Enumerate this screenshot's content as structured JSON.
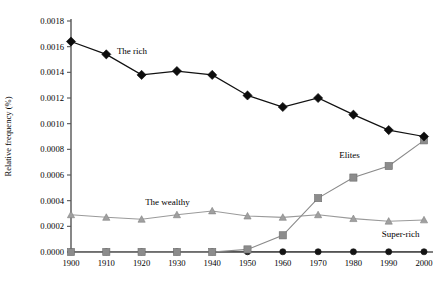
{
  "chart_data": {
    "type": "line",
    "title": "",
    "xlabel": "",
    "ylabel": "Relative frequency (%)",
    "x": [
      1900,
      1910,
      1920,
      1930,
      1940,
      1950,
      1960,
      1970,
      1980,
      1990,
      2000
    ],
    "xtick_labels": [
      "1900",
      "1910",
      "1920",
      "1930",
      "1940",
      "1950",
      "1960",
      "1970",
      "1980",
      "1990",
      "2000"
    ],
    "ytick_labels": [
      "0.0000",
      "0.0002",
      "0.0004",
      "0.0006",
      "0.0008",
      "0.0010",
      "0.0012",
      "0.0014",
      "0.0016",
      "0.0018"
    ],
    "ytick_values": [
      0.0,
      0.0002,
      0.0004,
      0.0006,
      0.0008,
      0.001,
      0.0012,
      0.0014,
      0.0016,
      0.0018
    ],
    "xlim": [
      1900,
      2000
    ],
    "ylim": [
      0.0,
      0.0018
    ],
    "grid": false,
    "legend_position": "inline-annotations",
    "series": [
      {
        "name": "The rich",
        "marker": "diamond",
        "color": "#0d0d0d",
        "label_x": 1913,
        "label_y": 0.00154,
        "values": [
          0.00164,
          0.00154,
          0.00138,
          0.00141,
          0.00138,
          0.00122,
          0.00113,
          0.0012,
          0.00107,
          0.00095,
          0.0009
        ]
      },
      {
        "name": "Elites",
        "marker": "square",
        "color": "#8c8c8c",
        "label_x": 1976,
        "label_y": 0.00073,
        "values": [
          0.0,
          0.0,
          0.0,
          0.0,
          0.0,
          2e-05,
          0.00013,
          0.00042,
          0.00058,
          0.00067,
          0.00087
        ]
      },
      {
        "name": "The wealthy",
        "marker": "triangle",
        "color": "#a0a0a0",
        "label_x": 1921,
        "label_y": 0.00037,
        "values": [
          0.00029,
          0.00027,
          0.000255,
          0.00029,
          0.00032,
          0.00028,
          0.00027,
          0.00029,
          0.00026,
          0.00024,
          0.00025
        ]
      },
      {
        "name": "Super-rich",
        "marker": "circle",
        "color": "#141414",
        "label_x": 1988,
        "label_y": 0.00012,
        "values": [
          2e-06,
          2e-06,
          2e-06,
          2e-06,
          2e-06,
          2e-06,
          2e-06,
          2e-06,
          2e-06,
          2e-06,
          2e-06
        ]
      }
    ]
  }
}
